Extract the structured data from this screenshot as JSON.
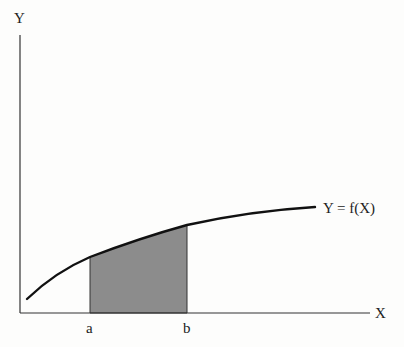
{
  "diagram": {
    "axes": {
      "y_label": "Y",
      "x_label": "X"
    },
    "curve_label": "Y = f(X)",
    "bounds": {
      "lower": "a",
      "upper": "b"
    },
    "colors": {
      "ink": "#1a1a1a",
      "shade": "#8a8a8a",
      "background": "#fdfdfc"
    }
  }
}
